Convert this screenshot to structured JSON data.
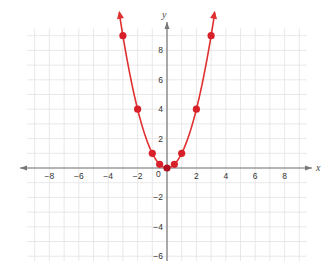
{
  "chart_data": {
    "type": "line",
    "title": "",
    "function": "y = x^2",
    "xlabel": "x",
    "ylabel": "y",
    "xlim": [
      -9.5,
      9.5
    ],
    "ylim": [
      -6.5,
      9.5
    ],
    "grid": true,
    "grid_step": 1,
    "x_ticks": [
      -8,
      -6,
      -4,
      -2,
      2,
      4,
      6,
      8
    ],
    "y_ticks": [
      8,
      6,
      4,
      2,
      -2,
      -4,
      -6
    ],
    "origin_label": "0",
    "series": [
      {
        "name": "parabola",
        "color": "#e03030",
        "points": [
          {
            "x": -3,
            "y": 9
          },
          {
            "x": -2,
            "y": 4
          },
          {
            "x": -1,
            "y": 1
          },
          {
            "x": -0.5,
            "y": 0.25
          },
          {
            "x": 0,
            "y": 0
          },
          {
            "x": 0.5,
            "y": 0.25
          },
          {
            "x": 1,
            "y": 1
          },
          {
            "x": 2,
            "y": 4
          },
          {
            "x": 3,
            "y": 9
          }
        ],
        "arrows_at_ends": true
      }
    ],
    "legend": null
  },
  "colors": {
    "curve": "#e03030",
    "point": "#d8202a",
    "vertex_point": "#b01020",
    "axis": "#777777",
    "grid": "#e2e2e2"
  },
  "labels": {
    "x_axis": "x",
    "y_axis": "y",
    "origin": "0"
  }
}
